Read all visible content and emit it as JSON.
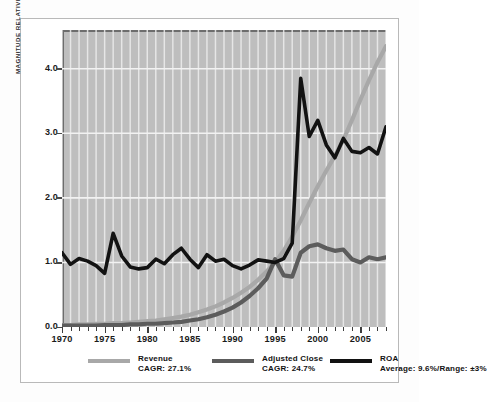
{
  "chart_data": {
    "type": "line",
    "title": "",
    "xlabel": "",
    "ylabel": "MAGNITUDE RELATIVE TO AVERAGE VALUE FOR THE PERIOD",
    "xlim": [
      1970,
      2008
    ],
    "ylim": [
      0.0,
      4.6
    ],
    "yticks": [
      "0.0",
      "1.0",
      "2.0",
      "3.0",
      "4.0"
    ],
    "ytick_values": [
      0.0,
      1.0,
      2.0,
      3.0,
      4.0
    ],
    "xticks": [
      "1970",
      "1975",
      "1980",
      "1985",
      "1990",
      "1995",
      "2000",
      "2005"
    ],
    "xtick_values": [
      1970,
      1975,
      1980,
      1985,
      1990,
      1995,
      2000,
      2005
    ],
    "grid": "vertical annual white gridlines plus horizontal gridlines at each y tick",
    "legend_position": "below-axis",
    "x": [
      1970,
      1971,
      1972,
      1973,
      1974,
      1975,
      1976,
      1977,
      1978,
      1979,
      1980,
      1981,
      1982,
      1983,
      1984,
      1985,
      1986,
      1987,
      1988,
      1989,
      1990,
      1991,
      1992,
      1993,
      1994,
      1995,
      1996,
      1997,
      1998,
      1999,
      2000,
      2001,
      2002,
      2003,
      2004,
      2005,
      2006,
      2007,
      2008
    ],
    "series": [
      {
        "name": "Revenue",
        "color": "#a8a8a8",
        "cagr_label": "CAGR: 27.1%",
        "values": [
          0.03,
          0.03,
          0.04,
          0.04,
          0.05,
          0.05,
          0.06,
          0.06,
          0.07,
          0.08,
          0.09,
          0.1,
          0.12,
          0.14,
          0.16,
          0.19,
          0.23,
          0.27,
          0.32,
          0.38,
          0.45,
          0.53,
          0.62,
          0.73,
          0.86,
          1.0,
          1.18,
          1.4,
          1.65,
          1.92,
          2.18,
          2.42,
          2.65,
          2.9,
          3.2,
          3.52,
          3.82,
          4.1,
          4.35
        ]
      },
      {
        "name": "Adjusted Close",
        "color": "#5c5c5c",
        "cagr_label": "CAGR: 24.7%",
        "values": [
          0.02,
          0.02,
          0.02,
          0.02,
          0.02,
          0.03,
          0.03,
          0.03,
          0.04,
          0.04,
          0.05,
          0.05,
          0.06,
          0.07,
          0.08,
          0.1,
          0.12,
          0.15,
          0.19,
          0.24,
          0.3,
          0.38,
          0.48,
          0.6,
          0.75,
          1.05,
          0.8,
          0.78,
          1.15,
          1.25,
          1.28,
          1.22,
          1.18,
          1.2,
          1.05,
          1.0,
          1.08,
          1.05,
          1.08
        ]
      },
      {
        "name": "ROA",
        "color": "#121212",
        "stat_label": "Average: 9.6%/Range: ±3%",
        "values": [
          1.15,
          0.97,
          1.06,
          1.02,
          0.95,
          0.83,
          1.45,
          1.1,
          0.93,
          0.9,
          0.92,
          1.05,
          0.98,
          1.12,
          1.22,
          1.05,
          0.92,
          1.12,
          1.02,
          1.05,
          0.95,
          0.9,
          0.96,
          1.04,
          1.02,
          1.0,
          1.06,
          1.3,
          3.85,
          2.95,
          3.2,
          2.82,
          2.62,
          2.92,
          2.72,
          2.7,
          2.78,
          2.68,
          3.1
        ]
      }
    ]
  },
  "legend": {
    "items": [
      {
        "name": "Revenue",
        "sub": "CAGR: 27.1%",
        "color": "#a8a8a8"
      },
      {
        "name": "Adjusted Close",
        "sub": "CAGR: 24.7%",
        "color": "#5c5c5c"
      },
      {
        "name": "ROA",
        "sub": "Average: 9.6%/Range: ±3%",
        "color": "#121212"
      }
    ]
  }
}
